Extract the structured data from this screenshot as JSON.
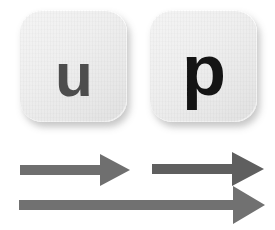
{
  "canvas": {
    "width": 275,
    "height": 230,
    "background_color": "#ffffff"
  },
  "keys": [
    {
      "name": "key-u",
      "label": "u",
      "face_color": "#efefef",
      "label_color": "#4d4d4d",
      "shadow_color": "rgba(90,90,90,0.34)"
    },
    {
      "name": "key-p",
      "label": "p",
      "face_color": "#efefef",
      "label_color": "#141414",
      "shadow_color": "rgba(90,90,90,0.34)"
    }
  ],
  "arrows": [
    {
      "name": "arrow-under-u",
      "direction": "right",
      "color": "#6f6f6f",
      "length": 108,
      "shaft_thickness": 9
    },
    {
      "name": "arrow-under-p",
      "direction": "right",
      "color": "#5f5f5f",
      "length": 108,
      "shaft_thickness": 10
    },
    {
      "name": "arrow-full-width",
      "direction": "right",
      "color": "#717171",
      "length": 240,
      "shaft_thickness": 9
    }
  ]
}
